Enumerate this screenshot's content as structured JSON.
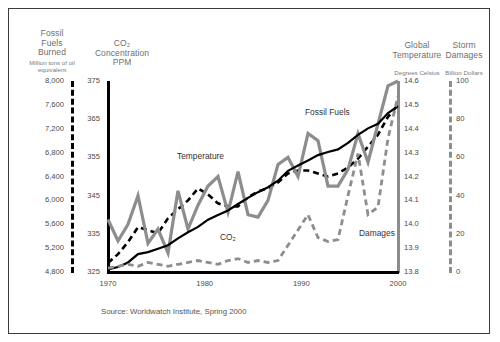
{
  "source_note": "Source: Worldwatch Institute, Spring 2000",
  "axes": {
    "fossil": {
      "title": "Fossil\nFuels\nBurned",
      "title_lines": [
        "Fossil",
        "Fuels",
        "Burned"
      ],
      "units": "Million tons of oil equivalent",
      "ticks": [
        "8,000",
        "7,600",
        "7,200",
        "6,800",
        "6,400",
        "6,000",
        "5,600",
        "5,200",
        "4,800"
      ],
      "range": [
        4800,
        8000
      ],
      "step": 400,
      "style": "black-dashed"
    },
    "co2": {
      "title_lines": [
        "CO₂",
        "Concentration",
        "PPM"
      ],
      "units": "PPM",
      "ticks": [
        "375",
        "365",
        "355",
        "345",
        "335",
        "325"
      ],
      "range": [
        325,
        375
      ],
      "step": 10,
      "style": "black-solid"
    },
    "temperature": {
      "title_lines": [
        "Global",
        "Temperature"
      ],
      "units": "Degrees Celsius",
      "ticks": [
        "14.6",
        "14.5",
        "14.4",
        "14.3",
        "14.2",
        "14.1",
        "14.0",
        "13.9",
        "13.8"
      ],
      "range": [
        13.8,
        14.6
      ],
      "step": 0.1,
      "style": "gray-solid"
    },
    "damages": {
      "title_lines": [
        "Storm",
        "Damages"
      ],
      "units": "Billion Dollars",
      "ticks": [
        "100",
        "80",
        "60",
        "40",
        "20",
        "0"
      ],
      "range": [
        0,
        100
      ],
      "step": 20,
      "style": "gray-dashed"
    }
  },
  "xaxis": {
    "ticks": [
      "1970",
      "1980",
      "1990",
      "2000"
    ],
    "range": [
      1970,
      2000
    ]
  },
  "series_labels": {
    "fossil": "Fossil Fuels",
    "temperature": "Temperature",
    "co2": "CO₂",
    "damages": "Damages"
  },
  "colors": {
    "black": "#000000",
    "gray": "#8d8d8d",
    "frame": "#3a3a3a",
    "tick_text": "#4a4a4a",
    "title_text": "#6e6e6e"
  },
  "chart_data": {
    "type": "line",
    "title": "",
    "xlabel": "",
    "ylabel": "",
    "grid": false,
    "legend": "inline-annotations",
    "x": [
      1970,
      1971,
      1972,
      1973,
      1974,
      1975,
      1976,
      1977,
      1978,
      1979,
      1980,
      1981,
      1982,
      1983,
      1984,
      1985,
      1986,
      1987,
      1988,
      1989,
      1990,
      1991,
      1992,
      1993,
      1994,
      1995,
      1996,
      1997,
      1998,
      1999
    ],
    "series": [
      {
        "name": "Fossil Fuels",
        "axis": "fossil",
        "unit": "Million tons of oil equivalent",
        "style": "black-dashed",
        "ylim": [
          4800,
          8000
        ],
        "values": [
          4950,
          5100,
          5300,
          5550,
          5500,
          5450,
          5700,
          5850,
          6000,
          6200,
          6100,
          5950,
          5900,
          5900,
          6050,
          6150,
          6200,
          6300,
          6450,
          6500,
          6500,
          6450,
          6400,
          6450,
          6550,
          6700,
          6900,
          7100,
          7400,
          7600
        ]
      },
      {
        "name": "Temperature",
        "axis": "temperature",
        "unit": "Degrees Celsius",
        "style": "gray-solid",
        "ylim": [
          13.8,
          14.6
        ],
        "values": [
          14.02,
          13.93,
          14.0,
          14.12,
          13.92,
          13.98,
          13.88,
          14.14,
          13.98,
          14.08,
          14.16,
          14.2,
          14.05,
          14.22,
          14.04,
          14.03,
          14.1,
          14.25,
          14.28,
          14.2,
          14.38,
          14.35,
          14.16,
          14.16,
          14.23,
          14.38,
          14.26,
          14.42,
          14.58,
          14.6
        ]
      },
      {
        "name": "CO2",
        "axis": "co2",
        "unit": "PPM",
        "style": "black-solid",
        "ylim": [
          325,
          375
        ],
        "values": [
          325.7,
          326.3,
          327.5,
          329.7,
          330.2,
          331.1,
          332.0,
          333.8,
          335.4,
          336.8,
          338.7,
          339.9,
          341.1,
          342.8,
          344.4,
          345.9,
          347.2,
          348.9,
          351.5,
          352.9,
          354.2,
          355.6,
          356.4,
          357.1,
          358.8,
          360.9,
          362.6,
          363.8,
          366.6,
          368.4
        ]
      },
      {
        "name": "Damages",
        "axis": "damages",
        "unit": "Billion Dollars",
        "style": "gray-dashed",
        "ylim": [
          0,
          100
        ],
        "values": [
          2,
          3,
          4,
          3,
          5,
          4,
          3,
          4,
          5,
          6,
          5,
          4,
          6,
          7,
          5,
          6,
          5,
          6,
          14,
          22,
          30,
          18,
          16,
          17,
          40,
          62,
          30,
          34,
          70,
          92
        ]
      }
    ]
  }
}
